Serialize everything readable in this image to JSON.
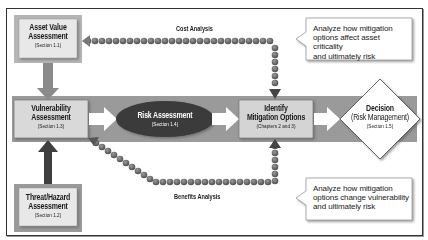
{
  "diagram": {
    "nodes": {
      "asset_value": {
        "title": "Asset Value Assessment",
        "title_line1": "Asset Value",
        "title_line2": "Assessment",
        "section": "(Section 1.1)"
      },
      "vulnerability": {
        "title_line1": "Vulnerability",
        "title_line2": "Assessment",
        "section": "(Section 1.3)"
      },
      "threat_hazard": {
        "title_line1": "Threat/Hazard",
        "title_line2": "Assessment",
        "section": "(Section 1.2)"
      },
      "risk": {
        "title": "Risk Assessment",
        "section": "(Section 1.4)"
      },
      "mitigation": {
        "title_line1": "Identify",
        "title_line2": "Mitigation Options",
        "section": "(Chapters 2 and 3)"
      },
      "decision": {
        "title_line1": "Decision",
        "title_line2": "(Risk Management)",
        "section": "(Section 1.5)"
      }
    },
    "flow_labels": {
      "cost": "Cost Analysis",
      "benefits": "Benefits Analysis"
    },
    "callouts": {
      "top": {
        "line1": "Analyze how mitigation",
        "line2": "options affect asset criticality",
        "line3": "and ultimately risk"
      },
      "bottom": {
        "line1": "Analyze how mitigation",
        "line2": "options change vulnerability",
        "line3": "and ultimately risk"
      }
    },
    "colors": {
      "band": "#9a9a9a",
      "box_fill": "#d9d9d9",
      "box_border": "#8a8a8a",
      "ellipse": "#3a3a3a",
      "dark_arrow": "#4a4a4a",
      "dotted_path": "#6a6a6a"
    }
  }
}
